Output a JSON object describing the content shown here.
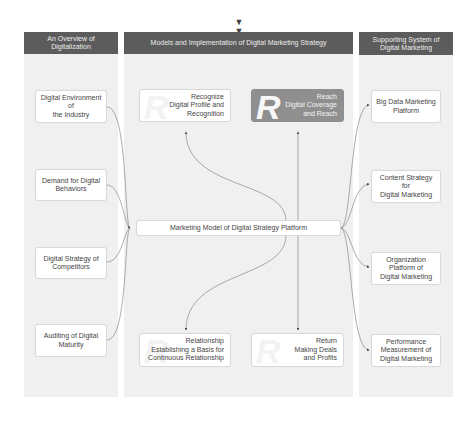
{
  "top_icon": "double-chevron-down",
  "columns": {
    "left": {
      "header": "An Overview of Digitalization",
      "items": [
        "Digital Environment of\nthe Industry",
        "Demand for Digital\nBehaviors",
        "Digital Strategy of\nCompetitors",
        "Auditing of Digital\nMaturity"
      ]
    },
    "middle": {
      "header": "Models and Implementation of Digital Marketing Strategy",
      "center": "Marketing Model of Digital Strategy Platform",
      "cards": [
        {
          "watermark": "R",
          "text": "Recognize\nDigital Profile and\nRecognition",
          "style": "light"
        },
        {
          "watermark": "R",
          "text": "Reach\nDigital Coverage\nand Reach",
          "style": "dark"
        },
        {
          "watermark": "R",
          "text": "Relationship\nEstablishing a Basis for\nContinuous Relationship",
          "style": "light"
        },
        {
          "watermark": "R",
          "text": "Return\nMaking Deals\nand Profits",
          "style": "light"
        }
      ]
    },
    "right": {
      "header": "Supporting System of\nDigital Marketing",
      "items": [
        "Big Data Marketing\nPlatform",
        "Content Strategy for\nDigital Marketing",
        "Organization\nPlatform of\nDigital Marketing",
        "Performance\nMeasurement of\nDigital Marketing"
      ]
    }
  },
  "colors": {
    "header_bg": "#5c5c5c",
    "panel_bg": "#f0f0f0",
    "highlight_card": "#8f8f8f",
    "line": "#555555"
  }
}
